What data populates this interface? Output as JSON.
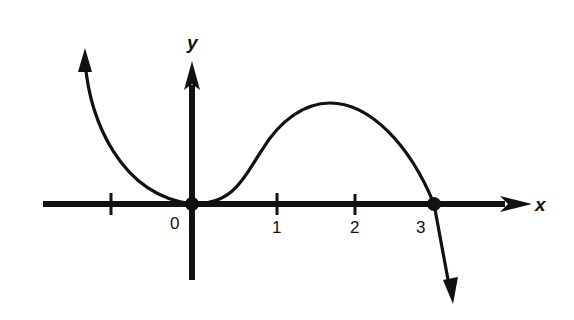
{
  "figure": {
    "type": "function-graph",
    "axes": {
      "x_label": "x",
      "y_label": "y",
      "x_ticks": [
        "",
        "0",
        "1",
        "2",
        "3"
      ],
      "x_tick_values": [
        -1,
        0,
        1,
        2,
        3
      ]
    },
    "marked_points": [
      {
        "label": "origin",
        "x": 0,
        "y": 0
      },
      {
        "label": "root",
        "x": 3,
        "y": 0
      }
    ],
    "curve": {
      "behavior_left": "rises to +infinity",
      "local_min_at_x": 0,
      "local_max_near_x": 1.8,
      "behavior_right": "falls to -infinity",
      "color": "#111111"
    }
  }
}
